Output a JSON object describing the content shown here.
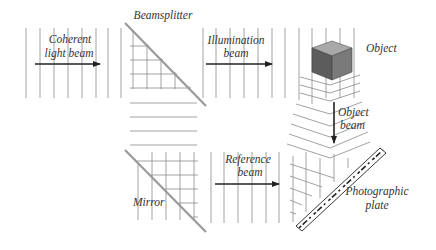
{
  "diagram": {
    "labels": {
      "coherent_line1": "Coherent",
      "coherent_line2": "light beam",
      "beamsplitter": "Beamsplitter",
      "illumination_line1": "Illumination",
      "illumination_line2": "beam",
      "object": "Object",
      "object_beam_line1": "Object",
      "object_beam_line2": "beam",
      "mirror": "Mirror",
      "reference_line1": "Reference",
      "reference_line2": "beam",
      "plate_line1": "Photographic",
      "plate_line2": "plate"
    },
    "components": [
      "Coherent light beam",
      "Beamsplitter",
      "Illumination beam",
      "Object",
      "Object beam",
      "Mirror",
      "Reference beam",
      "Photographic plate"
    ],
    "colors": {
      "line": "#8a8a8a",
      "arrow": "#222222",
      "cube_top": "#a8a8a8",
      "cube_front": "#5c5c5c",
      "cube_side": "#7a7a7a"
    }
  }
}
